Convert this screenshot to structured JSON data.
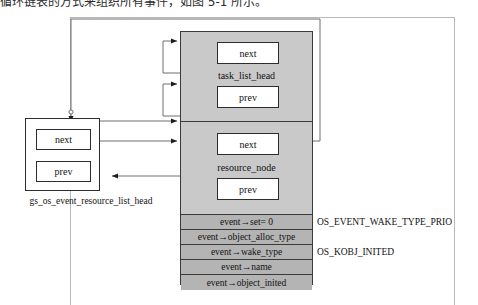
{
  "page": {
    "caption_top": "循环链表的方式来组织所有事件，如图 5-1 所示。",
    "background_color": "#ffffff"
  },
  "colors": {
    "block_fill": "#c9c9c9",
    "field_fill": "#b4b4b4",
    "stroke": "#3a3a3a",
    "box_stroke": "#2d2d2d",
    "frame": "#b9b9b9",
    "text": "#111111"
  },
  "event_block": {
    "name": "event-struct-block",
    "sections": [
      {
        "struct_label": "task_list_head",
        "pointers": [
          {
            "label": "next"
          },
          {
            "label": "prev"
          }
        ]
      },
      {
        "struct_label": "resource_node",
        "pointers": [
          {
            "label": "next"
          },
          {
            "label": "prev"
          }
        ]
      }
    ],
    "fields": [
      {
        "label": "event→set= 0",
        "annotation": ""
      },
      {
        "label": "event→object_alloc_type",
        "annotation": ""
      },
      {
        "label": "event→wake_type",
        "annotation": "OS_EVENT_WAKE_TYPE_PRIO"
      },
      {
        "label": "event→name",
        "annotation": ""
      },
      {
        "label": "event→object_inited",
        "annotation": "OS_KOBJ_INITED"
      }
    ]
  },
  "head_box": {
    "name": "gs-os-event-resource-list-head",
    "caption": "gs_os_event_resource_list_head",
    "pointers": [
      {
        "label": "next"
      },
      {
        "label": "prev"
      }
    ]
  },
  "annotations": {
    "wake_type_value": "OS_EVENT_WAKE_TYPE_PRIO",
    "object_inited_value": "OS_KOBJ_INITED"
  }
}
